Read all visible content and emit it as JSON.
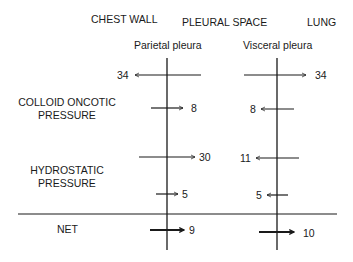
{
  "headers": {
    "chest_wall": "CHEST WALL",
    "pleural_space": "PLEURAL SPACE",
    "lung": "LUNG",
    "parietal": "Parietal pleura",
    "visceral": "Visceral pleura"
  },
  "rows": {
    "colloid_label_1": "COLLOID ONCOTIC",
    "colloid_label_2": "PRESSURE",
    "hydro_label_1": "HYDROSTATIC",
    "hydro_label_2": "PRESSURE",
    "net_label": "NET"
  },
  "forces": {
    "parietal_top": "34",
    "visceral_top": "34",
    "parietal_colloid": "8",
    "visceral_colloid": "8",
    "parietal_hydro": "30",
    "visceral_hydro": "11",
    "parietal_hydro2": "5",
    "visceral_hydro2": "5",
    "parietal_net": "9",
    "visceral_net": "10"
  }
}
